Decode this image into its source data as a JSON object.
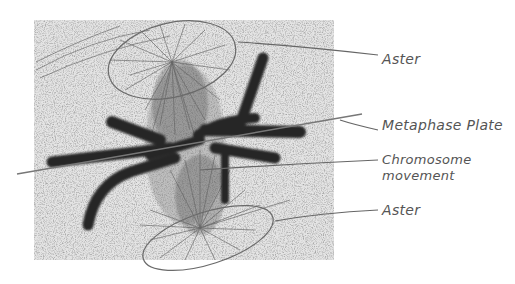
{
  "figure": {
    "colors": {
      "background": "#ffffff",
      "micrograph_bg": "#d9d9d9",
      "chromosome": "#262626",
      "spindle": "#555555",
      "leader_line": "#666666",
      "label_text": "#555555"
    },
    "labels": [
      {
        "id": "aster-top",
        "text": "Aster"
      },
      {
        "id": "metaphase-plate",
        "text": "Metaphase Plate"
      },
      {
        "id": "chromosome-movement",
        "line1": "Chromosome",
        "line2": "movement"
      },
      {
        "id": "aster-bottom",
        "text": "Aster"
      }
    ]
  }
}
